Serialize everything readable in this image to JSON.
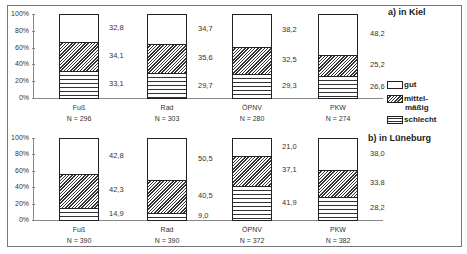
{
  "chart_data": [
    {
      "type": "bar",
      "stacked": true,
      "title": "a) in Kiel",
      "categories": [
        "Fuß",
        "Rad",
        "ÖPNV",
        "PKW"
      ],
      "sample_sizes": [
        "N = 296",
        "N = 303",
        "N = 280",
        "N = 274"
      ],
      "series": [
        {
          "name": "schlecht",
          "values": [
            33.1,
            29.7,
            29.3,
            26.6
          ]
        },
        {
          "name": "mittelmäßig",
          "values": [
            34.1,
            35.6,
            32.5,
            25.2
          ]
        },
        {
          "name": "gut",
          "values": [
            32.8,
            34.7,
            38.2,
            48.2
          ]
        }
      ],
      "labels": {
        "schlecht": [
          "33,1",
          "29,7",
          "29,3",
          "26,6"
        ],
        "mittelmäßig": [
          "34,1",
          "35,6",
          "32,5",
          "25,2"
        ],
        "gut": [
          "32,8",
          "34,7",
          "38,2",
          "48,2"
        ]
      },
      "ylim": [
        0,
        100
      ],
      "yticks": [
        "0%",
        "20%",
        "40%",
        "60%",
        "80%",
        "100%"
      ],
      "grid": false
    },
    {
      "type": "bar",
      "stacked": true,
      "title": "b) in Lüneburg",
      "categories": [
        "Fuß",
        "Rad",
        "ÖPNV",
        "PKW"
      ],
      "sample_sizes": [
        "N = 390",
        "N = 390",
        "N = 372",
        "N = 382"
      ],
      "series": [
        {
          "name": "schlecht",
          "values": [
            14.9,
            9.0,
            41.9,
            28.2
          ]
        },
        {
          "name": "mittelmäßig",
          "values": [
            42.3,
            40.5,
            37.1,
            33.8
          ]
        },
        {
          "name": "gut",
          "values": [
            42.8,
            50.5,
            21.0,
            38.0
          ]
        }
      ],
      "labels": {
        "schlecht": [
          "14,9",
          "9,0",
          "41,9",
          "28,2"
        ],
        "mittelmäßig": [
          "42,3",
          "40,5",
          "37,1",
          "33,8"
        ],
        "gut": [
          "42,8",
          "50,5",
          "21,0",
          "38,0"
        ]
      },
      "ylim": [
        0,
        100
      ],
      "yticks": [
        "0%",
        "20%",
        "40%",
        "60%",
        "80%",
        "100%"
      ],
      "grid": false
    }
  ],
  "legend": {
    "gut": "gut",
    "mid_line1": "mittel-",
    "mid_line2": "mäßig",
    "bad": "schlecht"
  }
}
